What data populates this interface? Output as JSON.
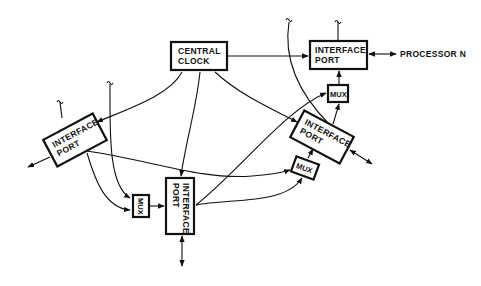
{
  "diagram": {
    "type": "block-diagram",
    "nodes": {
      "central_clock": {
        "line1": "CENTRAL",
        "line2": "CLOCK"
      },
      "port_top_right": {
        "line1": "INTERFACE",
        "line2": "PORT"
      },
      "port_right": {
        "line1": "INTERFACE",
        "line2": "PORT"
      },
      "port_left": {
        "line1": "INTERFACE",
        "line2": "PORT"
      },
      "port_bottom": {
        "line1": "INTERFACE",
        "line2": "PORT"
      },
      "mux_top_right": {
        "label": "MUX"
      },
      "mux_right": {
        "label": "MUX"
      },
      "mux_bottom_left": {
        "label": "MUX"
      }
    },
    "external_label": "PROCESSOR N",
    "colors": {
      "stroke": "#111111",
      "background": "#ffffff"
    }
  }
}
